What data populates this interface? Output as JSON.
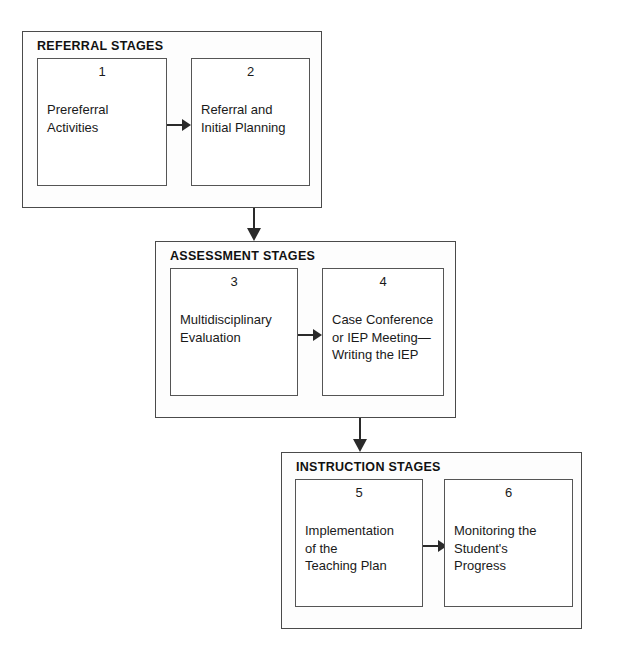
{
  "diagram": {
    "groups": [
      {
        "label": "REFERRAL STAGES",
        "stages": [
          {
            "number": "1",
            "text": "Prereferral\nActivities"
          },
          {
            "number": "2",
            "text": "Referral and\nInitial Planning"
          }
        ]
      },
      {
        "label": "ASSESSMENT STAGES",
        "stages": [
          {
            "number": "3",
            "text": "Multidisciplinary\nEvaluation"
          },
          {
            "number": "4",
            "text": "Case Conference\nor IEP Meeting—\nWriting the IEP"
          }
        ]
      },
      {
        "label": "INSTRUCTION STAGES",
        "stages": [
          {
            "number": "5",
            "text": "Implementation\nof the\nTeaching Plan"
          },
          {
            "number": "6",
            "text": "Monitoring the\nStudent's\nProgress"
          }
        ]
      }
    ],
    "colors": {
      "group_border": "#4a4a4a",
      "stage_border": "#555555",
      "arrow": "#2a2a2a",
      "background": "#ffffff",
      "text": "#1a1a1a"
    }
  }
}
